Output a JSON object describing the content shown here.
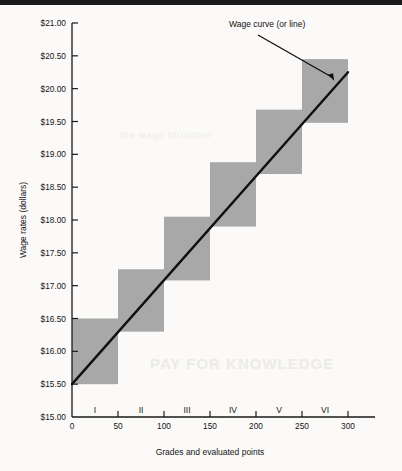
{
  "chart_data": {
    "type": "bar",
    "title": "",
    "xlabel": "Grades and evaluated points",
    "ylabel": "Wage rates (dollars)",
    "xlim": [
      0,
      300
    ],
    "ylim": [
      15.0,
      21.0
    ],
    "grid": false,
    "legend": "none",
    "x_ticks": [
      "0",
      "50",
      "100",
      "150",
      "200",
      "250",
      "300"
    ],
    "x_tick_values": [
      0,
      50,
      100,
      150,
      200,
      250,
      300
    ],
    "y_ticks": [
      "$15.00",
      "$15.50",
      "$16.00",
      "$16.50",
      "$17.00",
      "$17.50",
      "$18.00",
      "$18.50",
      "$19.00",
      "$19.50",
      "$20.00",
      "$20.50",
      "$21.00"
    ],
    "y_tick_values": [
      15.0,
      15.5,
      16.0,
      16.5,
      17.0,
      17.5,
      18.0,
      18.5,
      19.0,
      19.5,
      20.0,
      20.5,
      21.0
    ],
    "grade_labels": [
      "I",
      "II",
      "III",
      "IV",
      "V",
      "VI"
    ],
    "grade_bands": [
      {
        "grade": "I",
        "x_start": 0,
        "x_end": 50,
        "wage_min": 15.5,
        "wage_max": 16.5
      },
      {
        "grade": "II",
        "x_start": 50,
        "x_end": 100,
        "wage_min": 16.3,
        "wage_max": 17.25
      },
      {
        "grade": "III",
        "x_start": 100,
        "x_end": 150,
        "wage_min": 17.08,
        "wage_max": 18.05
      },
      {
        "grade": "IV",
        "x_start": 150,
        "x_end": 200,
        "wage_min": 17.9,
        "wage_max": 18.88
      },
      {
        "grade": "V",
        "x_start": 200,
        "x_end": 250,
        "wage_min": 18.7,
        "wage_max": 19.68
      },
      {
        "grade": "VI",
        "x_start": 250,
        "x_end": 300,
        "wage_min": 19.48,
        "wage_max": 20.45
      }
    ],
    "wage_line": {
      "name": "Wage curve (or line)",
      "points": [
        [
          0,
          15.5
        ],
        [
          300,
          20.25
        ]
      ]
    },
    "annotations": [
      {
        "text": "Wage curve (or line)",
        "target_x": 285,
        "target_y": 20.12
      }
    ],
    "colors": {
      "band_fill": "#a8a8a8",
      "line": "#101010",
      "axis": "#1a1a1a",
      "text": "#141414",
      "background": "#fbfaf8"
    }
  },
  "page": {
    "ghost_text_1": "PAY FOR KNOWLEDGE",
    "ghost_text_2": "the wage structure"
  }
}
